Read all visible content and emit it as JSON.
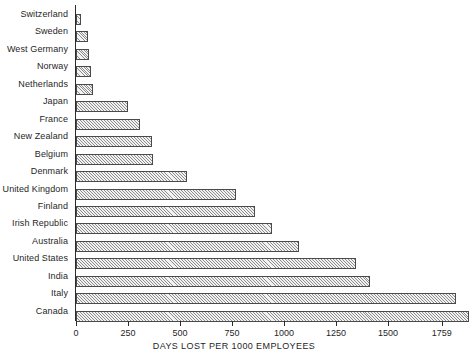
{
  "chart_data": {
    "type": "bar",
    "orientation": "horizontal",
    "title": "",
    "xlabel": "DAYS LOST PER 1000 EMPLOYEES",
    "ylabel": "",
    "xlim": [
      0,
      1900
    ],
    "xticks": [
      0,
      250,
      500,
      750,
      1000,
      1250,
      1500,
      1759
    ],
    "xtick_labels": [
      "0",
      "250",
      "500",
      "750",
      "1000",
      "1250",
      "1500",
      "1759"
    ],
    "grid": false,
    "legend": "none",
    "categories": [
      "Switzerland",
      "Sweden",
      "West Germany",
      "Norway",
      "Netherlands",
      "Japan",
      "France",
      "New Zealand",
      "Belgium",
      "Denmark",
      "United Kingdom",
      "Finland",
      "Irish Republic",
      "Australia",
      "United States",
      "India",
      "Italy",
      "Canada"
    ],
    "values": [
      25,
      60,
      62,
      70,
      80,
      250,
      310,
      365,
      370,
      535,
      770,
      860,
      940,
      1070,
      1345,
      1415,
      1825,
      1890
    ]
  },
  "axis": {
    "x_title": "DAYS LOST PER 1000 EMPLOYEES"
  }
}
